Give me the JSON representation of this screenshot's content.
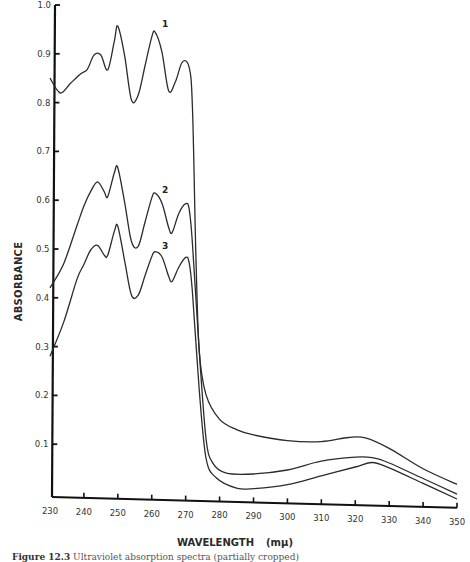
{
  "chart_data": {
    "type": "line",
    "title": "",
    "xlabel": "WAVELENGTH",
    "xunit": "(mμ)",
    "ylabel": "ABSORBANCE",
    "xlim": [
      230,
      350
    ],
    "ylim": [
      0,
      1.0
    ],
    "grid": false,
    "legend_position": "inline curve labels",
    "x_ticks": [
      230,
      240,
      250,
      260,
      270,
      280,
      290,
      300,
      310,
      320,
      330,
      340,
      350
    ],
    "y_ticks": [
      0.1,
      0.2,
      0.3,
      0.4,
      0.5,
      0.6,
      0.7,
      0.8,
      0.9,
      1.0
    ],
    "series": [
      {
        "name": "1",
        "label_position": {
          "x": 263,
          "y": 0.96
        },
        "points": [
          [
            230,
            0.85
          ],
          [
            233,
            0.82
          ],
          [
            236,
            0.84
          ],
          [
            239,
            0.86
          ],
          [
            241,
            0.87
          ],
          [
            243,
            0.9
          ],
          [
            245,
            0.9
          ],
          [
            247,
            0.87
          ],
          [
            249,
            0.93
          ],
          [
            250,
            0.96
          ],
          [
            252,
            0.9
          ],
          [
            254,
            0.81
          ],
          [
            256,
            0.82
          ],
          [
            258,
            0.88
          ],
          [
            260,
            0.94
          ],
          [
            261,
            0.95
          ],
          [
            263,
            0.91
          ],
          [
            265,
            0.83
          ],
          [
            267,
            0.85
          ],
          [
            269,
            0.89
          ],
          [
            271,
            0.88
          ],
          [
            272,
            0.8
          ],
          [
            273,
            0.5
          ],
          [
            274,
            0.3
          ],
          [
            276,
            0.21
          ],
          [
            280,
            0.16
          ],
          [
            285,
            0.14
          ],
          [
            290,
            0.13
          ],
          [
            300,
            0.12
          ],
          [
            310,
            0.12
          ],
          [
            318,
            0.13
          ],
          [
            323,
            0.13
          ],
          [
            330,
            0.11
          ],
          [
            340,
            0.07
          ],
          [
            350,
            0.04
          ]
        ]
      },
      {
        "name": "2",
        "label_position": {
          "x": 263,
          "y": 0.62
        },
        "points": [
          [
            230,
            0.42
          ],
          [
            234,
            0.47
          ],
          [
            238,
            0.55
          ],
          [
            240,
            0.59
          ],
          [
            242,
            0.62
          ],
          [
            244,
            0.64
          ],
          [
            246,
            0.62
          ],
          [
            247,
            0.61
          ],
          [
            249,
            0.66
          ],
          [
            250,
            0.67
          ],
          [
            252,
            0.6
          ],
          [
            254,
            0.52
          ],
          [
            256,
            0.51
          ],
          [
            258,
            0.56
          ],
          [
            260,
            0.61
          ],
          [
            261,
            0.62
          ],
          [
            263,
            0.6
          ],
          [
            265,
            0.55
          ],
          [
            266,
            0.54
          ],
          [
            268,
            0.58
          ],
          [
            270,
            0.6
          ],
          [
            271,
            0.59
          ],
          [
            272,
            0.52
          ],
          [
            274,
            0.3
          ],
          [
            276,
            0.12
          ],
          [
            278,
            0.07
          ],
          [
            282,
            0.05
          ],
          [
            290,
            0.05
          ],
          [
            300,
            0.06
          ],
          [
            310,
            0.08
          ],
          [
            320,
            0.09
          ],
          [
            325,
            0.09
          ],
          [
            330,
            0.08
          ],
          [
            340,
            0.05
          ],
          [
            350,
            0.02
          ]
        ]
      },
      {
        "name": "3",
        "label_position": {
          "x": 263,
          "y": 0.505
        },
        "points": [
          [
            230,
            0.28
          ],
          [
            234,
            0.35
          ],
          [
            238,
            0.44
          ],
          [
            240,
            0.47
          ],
          [
            242,
            0.5
          ],
          [
            244,
            0.51
          ],
          [
            246,
            0.49
          ],
          [
            247,
            0.49
          ],
          [
            249,
            0.54
          ],
          [
            250,
            0.55
          ],
          [
            252,
            0.48
          ],
          [
            254,
            0.41
          ],
          [
            256,
            0.41
          ],
          [
            258,
            0.45
          ],
          [
            260,
            0.49
          ],
          [
            261,
            0.5
          ],
          [
            263,
            0.49
          ],
          [
            265,
            0.45
          ],
          [
            266,
            0.44
          ],
          [
            268,
            0.47
          ],
          [
            270,
            0.49
          ],
          [
            271,
            0.48
          ],
          [
            272,
            0.42
          ],
          [
            274,
            0.22
          ],
          [
            276,
            0.08
          ],
          [
            279,
            0.04
          ],
          [
            285,
            0.02
          ],
          [
            290,
            0.02
          ],
          [
            300,
            0.03
          ],
          [
            310,
            0.05
          ],
          [
            320,
            0.07
          ],
          [
            325,
            0.08
          ],
          [
            330,
            0.07
          ],
          [
            340,
            0.04
          ],
          [
            350,
            0.01
          ]
        ]
      }
    ]
  },
  "axes": {
    "ylabel": "ABSORBANCE",
    "xlabel": "WAVELENGTH",
    "xunit": "(mμ)"
  },
  "caption": {
    "figure_number": "Figure 12.3",
    "text": "Ultraviolet absorption spectra (partially cropped)"
  }
}
